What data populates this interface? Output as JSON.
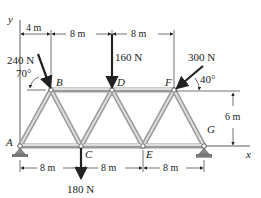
{
  "diagram": {
    "type": "truss",
    "axes": {
      "y_label": "y",
      "x_label": "x"
    },
    "nodes": [
      {
        "id": "A",
        "label": "A"
      },
      {
        "id": "B",
        "label": "B"
      },
      {
        "id": "C",
        "label": "C"
      },
      {
        "id": "D",
        "label": "D"
      },
      {
        "id": "E",
        "label": "E"
      },
      {
        "id": "F",
        "label": "F"
      },
      {
        "id": "G",
        "label": "G"
      }
    ],
    "loads": {
      "B": {
        "magnitude": "240 N",
        "angle": "70°"
      },
      "D": {
        "magnitude": "160 N"
      },
      "F": {
        "magnitude": "300 N",
        "angle": "40°"
      },
      "C": {
        "magnitude": "180 N"
      }
    },
    "dimensions": {
      "top": [
        "4 m",
        "8 m",
        "8 m"
      ],
      "bottom": [
        "8 m",
        "8 m",
        "8 m"
      ],
      "height": "6 m"
    }
  }
}
